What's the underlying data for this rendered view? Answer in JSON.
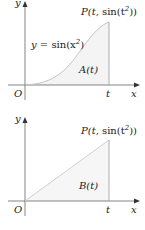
{
  "panels": [
    {
      "id": "top",
      "axis_labels": {
        "y": "y",
        "x": "x",
        "origin": "O",
        "t": "t"
      },
      "curve_label": {
        "prefix": "y = ",
        "fn": "sin",
        "open": "(x",
        "exp": "2",
        "close": ")"
      },
      "point_label": {
        "prefix": "P(t, ",
        "fn": "sin",
        "open": "(t",
        "exp": "2",
        "close": "))"
      },
      "area_label": "A(t)",
      "shape": "curve y = sin(x^2) from 0 to t",
      "colors": {
        "axis": "#555555",
        "curve": "#c8c8c8",
        "fill": "#f3f3f3"
      }
    },
    {
      "id": "bottom",
      "axis_labels": {
        "y": "y",
        "x": "x",
        "origin": "O",
        "t": "t"
      },
      "point_label": {
        "prefix": "P(t, ",
        "fn": "sin",
        "open": "(t",
        "exp": "2",
        "close": "))"
      },
      "area_label": "B(t)",
      "shape": "triangle from O to P(t, sin(t^2))",
      "colors": {
        "axis": "#555555",
        "line": "#cfcfcf",
        "fill": "#f3f3f3"
      }
    }
  ]
}
